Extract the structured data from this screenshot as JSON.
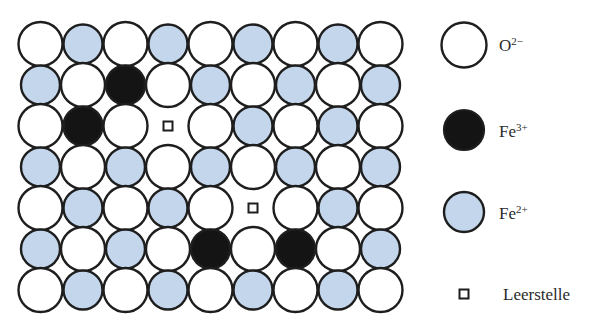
{
  "diagram": {
    "title": "",
    "grid": {
      "columns": 9,
      "rows": 7,
      "legend_key": {
        "O": "oxide",
        "F": "fe2",
        "B": "fe3",
        "V": "vacancy"
      },
      "cells": [
        [
          "O",
          "F",
          "O",
          "F",
          "O",
          "F",
          "O",
          "F",
          "O"
        ],
        [
          "F",
          "O",
          "B",
          "O",
          "F",
          "O",
          "F",
          "O",
          "F"
        ],
        [
          "O",
          "B",
          "O",
          "V",
          "O",
          "F",
          "O",
          "F",
          "O"
        ],
        [
          "F",
          "O",
          "F",
          "O",
          "F",
          "O",
          "F",
          "O",
          "F"
        ],
        [
          "O",
          "F",
          "O",
          "F",
          "O",
          "V",
          "O",
          "F",
          "O"
        ],
        [
          "F",
          "O",
          "F",
          "O",
          "B",
          "O",
          "B",
          "O",
          "F"
        ],
        [
          "O",
          "F",
          "O",
          "F",
          "O",
          "F",
          "O",
          "F",
          "O"
        ]
      ]
    },
    "colors": {
      "oxide_fill": "#ffffff",
      "fe2_fill": "#c3d6ec",
      "fe3_fill": "#141414",
      "stroke": "#1e1e1e",
      "text": "#2a2a2a"
    },
    "legend": [
      {
        "id": "oxide",
        "symbol": "O",
        "charge": "2−"
      },
      {
        "id": "fe3",
        "symbol": "Fe",
        "charge": "3+"
      },
      {
        "id": "fe2",
        "symbol": "Fe",
        "charge": "2+"
      },
      {
        "id": "vacancy",
        "label": "Leerstelle"
      }
    ]
  }
}
